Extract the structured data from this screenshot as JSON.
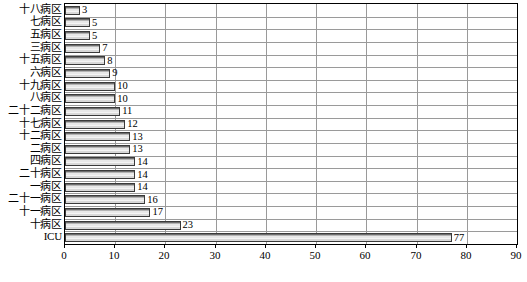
{
  "chart_data": {
    "type": "bar",
    "orientation": "horizontal",
    "title": "",
    "xlabel": "",
    "ylabel": "",
    "xlim": [
      0,
      90
    ],
    "xticks": [
      0,
      10,
      20,
      30,
      40,
      50,
      60,
      70,
      80,
      90
    ],
    "grid": true,
    "legend": false,
    "show_value_labels": true,
    "categories": [
      "十八病区",
      "七病区",
      "五病区",
      "三病区",
      "十五病区",
      "六病区",
      "十九病区",
      "八病区",
      "二十二病区",
      "十七病区",
      "十二病区",
      "二病区",
      "四病区",
      "二十病区",
      "一病区",
      "二十一病区",
      "十一病区",
      "十病区",
      "ICU"
    ],
    "values": [
      3,
      5,
      5,
      7,
      8,
      9,
      10,
      10,
      11,
      12,
      13,
      13,
      14,
      14,
      14,
      16,
      17,
      23,
      77
    ],
    "value_labels": [
      "3",
      "5",
      "5",
      "7",
      "8",
      "9",
      "10",
      "10",
      "11",
      "12",
      "13",
      "13",
      "14",
      "14",
      "14",
      "16",
      "17",
      "23",
      "77"
    ],
    "colors": {
      "bar_fill_light": "#e8e8e8",
      "bar_fill_mid": "#b4b4b4",
      "bar_fill_dark": "#6e6e6e",
      "bar_border": "#3a3a3a",
      "grid": "#9a9a9a",
      "axis": "#000000",
      "background": "#ffffff",
      "text": "#000000"
    }
  }
}
